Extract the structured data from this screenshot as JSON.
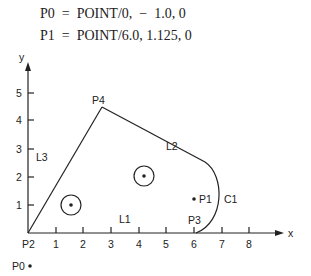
{
  "statements": [
    {
      "text": "P0  =  POINT/0,  −  1.0, 0"
    },
    {
      "text": "P1  =  POINT/6.0, 1.125, 0"
    }
  ],
  "axes": {
    "x_label": "x",
    "y_label": "y",
    "x_ticks": [
      "1",
      "2",
      "3",
      "4",
      "5",
      "6",
      "7",
      "8"
    ],
    "y_ticks": [
      "1",
      "2",
      "3",
      "4",
      "5"
    ]
  },
  "labels": {
    "p0": "P0",
    "p1": "P1",
    "p2": "P2",
    "p3": "P3",
    "p4": "P4",
    "l1": "L1",
    "l2": "L2",
    "l3": "L3",
    "c1": "C1"
  },
  "colors": {
    "ink": "#222222",
    "background": "#ffffff"
  }
}
